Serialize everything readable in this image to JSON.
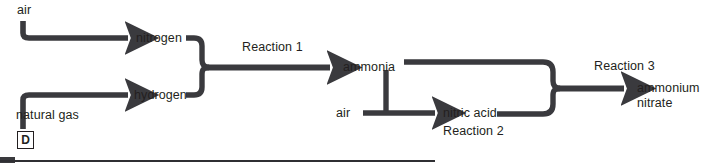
{
  "diagram": {
    "question_label": "D",
    "stroke_color": "#3a3a3e",
    "text_color": "#231f20",
    "inputs": [
      {
        "id": "air-top",
        "label": "air"
      },
      {
        "id": "natural-gas",
        "label": "natural gas"
      },
      {
        "id": "air-mid",
        "label": "air"
      }
    ],
    "intermediates": [
      {
        "id": "nitrogen",
        "label": "nitrogen"
      },
      {
        "id": "hydrogen",
        "label": "hydrogen"
      },
      {
        "id": "ammonia",
        "label": "ammonia"
      },
      {
        "id": "nitric-acid",
        "label": "nitric acid"
      }
    ],
    "reactions": [
      {
        "id": "reaction-1",
        "label": "Reaction 1"
      },
      {
        "id": "reaction-2",
        "label": "Reaction 2"
      },
      {
        "id": "reaction-3",
        "label": "Reaction 3"
      }
    ],
    "product": {
      "id": "ammonium-nitrate",
      "line1": "ammonium",
      "line2": "nitrate"
    }
  }
}
